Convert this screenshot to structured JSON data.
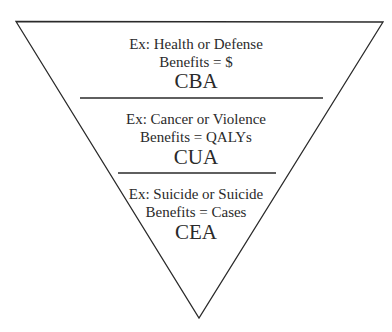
{
  "diagram": {
    "shape": "inverted-triangle",
    "line_color": "#2a2a2a",
    "sections": [
      {
        "example": "Ex: Health or Defense",
        "benefits": "Benefits = $",
        "method": "CBA"
      },
      {
        "example": "Ex: Cancer or Violence",
        "benefits": "Benefits = QALYs",
        "method": "CUA"
      },
      {
        "example": "Ex: Suicide or Suicide",
        "benefits": "Benefits = Cases",
        "method": "CEA"
      }
    ]
  }
}
